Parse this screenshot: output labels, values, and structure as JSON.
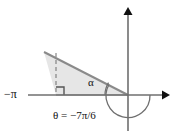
{
  "figure": {
    "type": "trigonometry-reference-angle-diagram",
    "labels": {
      "neg_pi": "−π",
      "alpha": "α",
      "theta_equation": "θ = −7π/6"
    },
    "colors": {
      "axis": "#6f6f6f",
      "arrow": "#111111",
      "triangle_fill": "#e6e6e6",
      "triangle_stroke": "#8a8a8a",
      "dashed_line": "#6f6f6f",
      "arc": "#6f6f6f",
      "text": "#111111",
      "background": "#ffffff"
    },
    "geometry": {
      "origin_x": 128,
      "origin_y": 95,
      "x_axis_start_x": 28,
      "x_axis_end_x": 170,
      "y_axis_top_y": 8,
      "y_axis_bottom_y": 131,
      "triangle_apex_x": 44,
      "triangle_apex_y": 52,
      "triangle_base_corner_x": 56,
      "triangle_base_corner_y": 95,
      "theta_degrees": -210,
      "alpha_degrees": 30,
      "theta_radians": "-7π/6",
      "alpha_radians": "π/6"
    }
  }
}
